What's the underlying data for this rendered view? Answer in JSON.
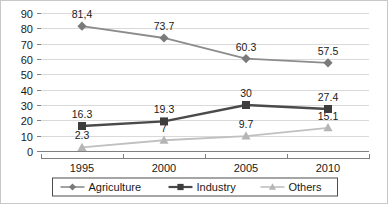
{
  "chart_data": {
    "type": "line",
    "title": "",
    "xlabel": "",
    "ylabel": "",
    "categories": [
      "1995",
      "2000",
      "2005",
      "2010"
    ],
    "ylim": [
      0,
      90
    ],
    "yticks": [
      0,
      10,
      20,
      30,
      40,
      50,
      60,
      70,
      80,
      90
    ],
    "grid": true,
    "legend_position": "bottom",
    "series": [
      {
        "name": "Agriculture",
        "marker": "diamond",
        "color": "#7a7a7a",
        "line_color": "#8c8c8c",
        "values": [
          81.4,
          73.7,
          60.3,
          57.5
        ],
        "labels": [
          "81,4",
          "73.7",
          "60.3",
          "57.5"
        ]
      },
      {
        "name": "Industry",
        "marker": "square",
        "color": "#3d3d3d",
        "line_color": "#4a4a4a",
        "values": [
          16.3,
          19.3,
          30,
          27.4
        ],
        "labels": [
          "16.3",
          "19.3",
          "30",
          "27.4"
        ]
      },
      {
        "name": "Others",
        "marker": "triangle",
        "color": "#b5b5b5",
        "line_color": "#c0c0c0",
        "values": [
          2.3,
          7,
          9.7,
          15.1
        ],
        "labels": [
          "2.3",
          "7",
          "9.7",
          "15.1"
        ]
      }
    ]
  },
  "axis": {
    "y_tick_labels": [
      "90",
      "80",
      "70",
      "60",
      "50",
      "40",
      "30",
      "20",
      "10",
      "0"
    ],
    "x_tick_labels": [
      "1995",
      "2000",
      "2005",
      "2010"
    ]
  },
  "legend": {
    "items": [
      {
        "label": "Agriculture",
        "marker": "diamond-marker-icon"
      },
      {
        "label": "Industry",
        "marker": "square-marker-icon"
      },
      {
        "label": "Others",
        "marker": "triangle-marker-icon"
      }
    ]
  }
}
